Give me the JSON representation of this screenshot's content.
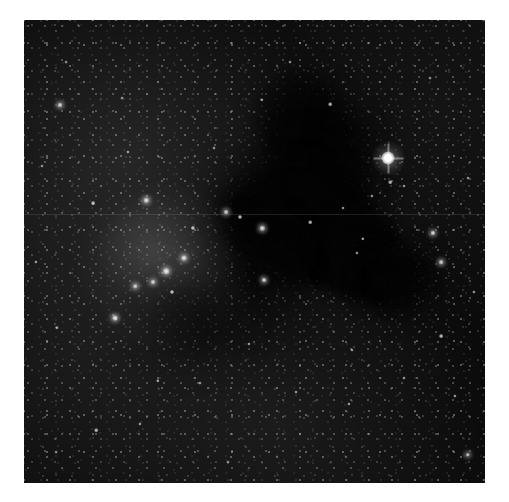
{
  "figure": {
    "kind": "astronomical-plate-photograph",
    "title": "Star field with dark nebula and open cluster",
    "color_mode": "grayscale",
    "border_color": "#ffffff",
    "sky_background_color": "#0b0b0b",
    "dust_cloud_color": "#040404",
    "star_color": "#ffffff",
    "canvas": {
      "width": 509,
      "height": 502
    },
    "frame": {
      "left": 24,
      "top": 20,
      "width": 461,
      "height": 463
    }
  },
  "features": [
    {
      "name": "dominant-star",
      "label": "Bright foreground star",
      "x": 388,
      "y": 158,
      "size": 13,
      "brightness": 1.0,
      "has_diffraction_spikes": true
    },
    {
      "name": "open-cluster",
      "label": "Open star cluster",
      "center_x": 160,
      "center_y": 268,
      "radius": 82
    },
    {
      "name": "dark-nebula",
      "label": "Dark absorption nebula",
      "center_x": 365,
      "center_y": 255,
      "extent_x": 180,
      "extent_y": 175
    },
    {
      "name": "secondary-dark-patch",
      "label": "Secondary dust patch",
      "center_x": 215,
      "center_y": 335,
      "extent_x": 80,
      "extent_y": 75
    },
    {
      "name": "scan-seam",
      "label": "Plate scan seam line",
      "y": 214
    }
  ],
  "dust_lobes": [
    {
      "x": 300,
      "y": 120,
      "w": 78,
      "h": 96,
      "blur": "soft",
      "o": 0.85
    },
    {
      "x": 316,
      "y": 150,
      "w": 96,
      "h": 110,
      "blur": "soft",
      "o": 0.95
    },
    {
      "x": 300,
      "y": 196,
      "w": 130,
      "h": 90,
      "blur": "vsoft",
      "o": 0.8
    },
    {
      "x": 292,
      "y": 214,
      "w": 150,
      "h": 96,
      "blur": "soft",
      "o": 1.0
    },
    {
      "x": 305,
      "y": 228,
      "w": 128,
      "h": 92,
      "blur": "",
      "o": 1.0
    },
    {
      "x": 330,
      "y": 248,
      "w": 110,
      "h": 78,
      "blur": "",
      "o": 1.0
    },
    {
      "x": 356,
      "y": 244,
      "w": 86,
      "h": 70,
      "blur": "",
      "o": 1.0
    },
    {
      "x": 362,
      "y": 272,
      "w": 72,
      "h": 62,
      "blur": "",
      "o": 1.0
    },
    {
      "x": 384,
      "y": 282,
      "w": 58,
      "h": 50,
      "blur": "",
      "o": 1.0
    },
    {
      "x": 400,
      "y": 262,
      "w": 44,
      "h": 42,
      "blur": "soft",
      "o": 0.9
    },
    {
      "x": 412,
      "y": 276,
      "w": 50,
      "h": 44,
      "blur": "soft",
      "o": 0.95
    },
    {
      "x": 398,
      "y": 300,
      "w": 46,
      "h": 34,
      "blur": "soft",
      "o": 0.85
    },
    {
      "x": 268,
      "y": 252,
      "w": 70,
      "h": 64,
      "blur": "soft",
      "o": 0.72
    },
    {
      "x": 262,
      "y": 286,
      "w": 62,
      "h": 54,
      "blur": "vsoft",
      "o": 0.6
    },
    {
      "x": 180,
      "y": 300,
      "w": 86,
      "h": 66,
      "blur": "vsoft",
      "o": 0.55
    },
    {
      "x": 196,
      "y": 326,
      "w": 70,
      "h": 56,
      "blur": "vsoft",
      "o": 0.5
    },
    {
      "x": 336,
      "y": 178,
      "w": 60,
      "h": 54,
      "blur": "soft",
      "o": 0.7
    },
    {
      "x": 368,
      "y": 132,
      "w": 52,
      "h": 48,
      "blur": "vsoft",
      "o": 0.55
    },
    {
      "x": 252,
      "y": 330,
      "w": 54,
      "h": 40,
      "blur": "vsoft",
      "o": 0.42
    }
  ],
  "cluster_glows": [
    {
      "x": 162,
      "y": 266,
      "r": 86,
      "a": 0.1
    },
    {
      "x": 150,
      "y": 250,
      "r": 54,
      "a": 0.09
    },
    {
      "x": 176,
      "y": 284,
      "r": 46,
      "a": 0.08
    }
  ],
  "bright_stars": [
    {
      "x": 60,
      "y": 105,
      "s": 5.0,
      "b": 0.92,
      "g": 1
    },
    {
      "x": 115,
      "y": 318,
      "s": 6.0,
      "b": 0.98,
      "g": 1
    },
    {
      "x": 146,
      "y": 200,
      "s": 5.5,
      "b": 0.95,
      "g": 1
    },
    {
      "x": 166,
      "y": 271,
      "s": 6.5,
      "b": 1.0,
      "g": 1
    },
    {
      "x": 184,
      "y": 258,
      "s": 6.0,
      "b": 0.97,
      "g": 1
    },
    {
      "x": 153,
      "y": 282,
      "s": 5.0,
      "b": 0.9,
      "g": 1
    },
    {
      "x": 135,
      "y": 286,
      "s": 4.5,
      "b": 0.88,
      "g": 1
    },
    {
      "x": 172,
      "y": 292,
      "s": 4.0,
      "b": 0.84,
      "g": 0
    },
    {
      "x": 193,
      "y": 228,
      "s": 4.2,
      "b": 0.86,
      "g": 0
    },
    {
      "x": 226,
      "y": 212,
      "s": 4.8,
      "b": 0.9,
      "g": 1
    },
    {
      "x": 240,
      "y": 217,
      "s": 4.0,
      "b": 0.84,
      "g": 0
    },
    {
      "x": 262,
      "y": 228,
      "s": 5.5,
      "b": 0.95,
      "g": 1
    },
    {
      "x": 264,
      "y": 280,
      "s": 5.0,
      "b": 0.92,
      "g": 1
    },
    {
      "x": 310,
      "y": 222,
      "s": 3.6,
      "b": 0.8,
      "g": 0
    },
    {
      "x": 363,
      "y": 239,
      "s": 3.4,
      "b": 0.78,
      "g": 0
    },
    {
      "x": 433,
      "y": 233,
      "s": 5.2,
      "b": 0.95,
      "g": 1
    },
    {
      "x": 441,
      "y": 262,
      "s": 4.6,
      "b": 0.9,
      "g": 1
    },
    {
      "x": 357,
      "y": 253,
      "s": 3.2,
      "b": 0.74,
      "g": 0
    },
    {
      "x": 343,
      "y": 208,
      "s": 3.0,
      "b": 0.72,
      "g": 0
    },
    {
      "x": 372,
      "y": 196,
      "s": 3.2,
      "b": 0.74,
      "g": 0
    },
    {
      "x": 404,
      "y": 186,
      "s": 3.0,
      "b": 0.72,
      "g": 0
    },
    {
      "x": 390,
      "y": 182,
      "s": 3.6,
      "b": 0.8,
      "g": 0
    },
    {
      "x": 468,
      "y": 455,
      "s": 4.4,
      "b": 0.88,
      "g": 1
    },
    {
      "x": 441,
      "y": 336,
      "s": 3.8,
      "b": 0.82,
      "g": 0
    },
    {
      "x": 330,
      "y": 104,
      "s": 3.6,
      "b": 0.8,
      "g": 0
    },
    {
      "x": 262,
      "y": 100,
      "s": 3.4,
      "b": 0.78,
      "g": 0
    },
    {
      "x": 93,
      "y": 203,
      "s": 3.8,
      "b": 0.82,
      "g": 0
    },
    {
      "x": 57,
      "y": 328,
      "s": 3.4,
      "b": 0.78,
      "g": 0
    },
    {
      "x": 96,
      "y": 430,
      "s": 3.6,
      "b": 0.8,
      "g": 0
    },
    {
      "x": 140,
      "y": 424,
      "s": 3.2,
      "b": 0.74,
      "g": 0
    },
    {
      "x": 158,
      "y": 381,
      "s": 3.4,
      "b": 0.76,
      "g": 0
    },
    {
      "x": 200,
      "y": 383,
      "s": 3.0,
      "b": 0.72,
      "g": 0
    },
    {
      "x": 249,
      "y": 344,
      "s": 3.2,
      "b": 0.74,
      "g": 0
    },
    {
      "x": 296,
      "y": 392,
      "s": 3.0,
      "b": 0.72,
      "g": 0
    },
    {
      "x": 349,
      "y": 404,
      "s": 3.2,
      "b": 0.74,
      "g": 0
    },
    {
      "x": 404,
      "y": 378,
      "s": 3.0,
      "b": 0.72,
      "g": 0
    },
    {
      "x": 455,
      "y": 396,
      "s": 3.2,
      "b": 0.74,
      "g": 0
    },
    {
      "x": 214,
      "y": 148,
      "s": 3.0,
      "b": 0.72,
      "g": 0
    },
    {
      "x": 128,
      "y": 152,
      "s": 3.2,
      "b": 0.74,
      "g": 0
    },
    {
      "x": 42,
      "y": 166,
      "s": 3.0,
      "b": 0.7,
      "g": 0
    },
    {
      "x": 36,
      "y": 262,
      "s": 3.2,
      "b": 0.74,
      "g": 0
    },
    {
      "x": 468,
      "y": 178,
      "s": 3.0,
      "b": 0.7,
      "g": 0
    },
    {
      "x": 474,
      "y": 292,
      "s": 3.2,
      "b": 0.74,
      "g": 0
    },
    {
      "x": 122,
      "y": 98,
      "s": 2.8,
      "b": 0.68,
      "g": 0
    },
    {
      "x": 290,
      "y": 62,
      "s": 3.0,
      "b": 0.7,
      "g": 0
    },
    {
      "x": 430,
      "y": 78,
      "s": 3.0,
      "b": 0.7,
      "g": 0
    },
    {
      "x": 66,
      "y": 62,
      "s": 2.8,
      "b": 0.66,
      "g": 0
    },
    {
      "x": 352,
      "y": 350,
      "s": 3.0,
      "b": 0.7,
      "g": 0
    },
    {
      "x": 228,
      "y": 462,
      "s": 3.0,
      "b": 0.7,
      "g": 0
    },
    {
      "x": 56,
      "y": 452,
      "s": 2.8,
      "b": 0.66,
      "g": 0
    }
  ]
}
